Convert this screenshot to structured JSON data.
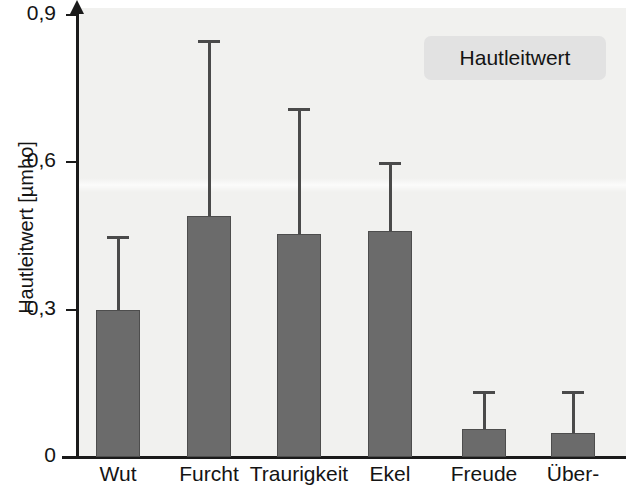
{
  "chart_data": {
    "type": "bar",
    "title": "",
    "xlabel": "",
    "ylabel": "Hautleitwert [µmho]",
    "ylim": [
      0,
      0.9
    ],
    "yticks": [
      "0",
      "0,3",
      "0,6",
      "0,9"
    ],
    "ytick_values": [
      0,
      0.3,
      0.6,
      0.9
    ],
    "grid": false,
    "legend_position": "top-right",
    "legend_entries": [
      "Hautleitwert"
    ],
    "categories": [
      "Wut",
      "Furcht",
      "Traurigkeit",
      "Ekel",
      "Freude",
      "Über-"
    ],
    "values": [
      0.3,
      0.49,
      0.455,
      0.46,
      0.057,
      0.048
    ],
    "error_upper": [
      0.45,
      0.85,
      0.71,
      0.6,
      0.135,
      0.135
    ],
    "series": [
      {
        "name": "Hautleitwert",
        "values": [
          0.3,
          0.49,
          0.455,
          0.46,
          0.057,
          0.048
        ],
        "error_upper": [
          0.45,
          0.85,
          0.71,
          0.6,
          0.135,
          0.135
        ]
      }
    ],
    "colors": {
      "bar_fill": "#6b6b6b",
      "bar_edge": "#4d4d4d",
      "panel_background": "#f1f1ef",
      "axis": "#1a1a1a",
      "legend_background": "#e2e2e2",
      "text": "#141414"
    }
  },
  "axes": {
    "y_title": "Hautleitwert [µmho]",
    "ticks": [
      {
        "label": "0,9",
        "value": 0.9
      },
      {
        "label": "0,6",
        "value": 0.6
      },
      {
        "label": "0,3",
        "value": 0.3
      },
      {
        "label": "0",
        "value": 0
      }
    ]
  },
  "legend": {
    "label": "Hautleitwert"
  },
  "bars": [
    {
      "label": "Wut",
      "value": 0.3,
      "error_upper": 0.45
    },
    {
      "label": "Furcht",
      "value": 0.49,
      "error_upper": 0.85
    },
    {
      "label": "Traurigkeit",
      "value": 0.455,
      "error_upper": 0.71
    },
    {
      "label": "Ekel",
      "value": 0.46,
      "error_upper": 0.6
    },
    {
      "label": "Freude",
      "value": 0.057,
      "error_upper": 0.135
    },
    {
      "label": "Über-",
      "value": 0.048,
      "error_upper": 0.135
    }
  ]
}
